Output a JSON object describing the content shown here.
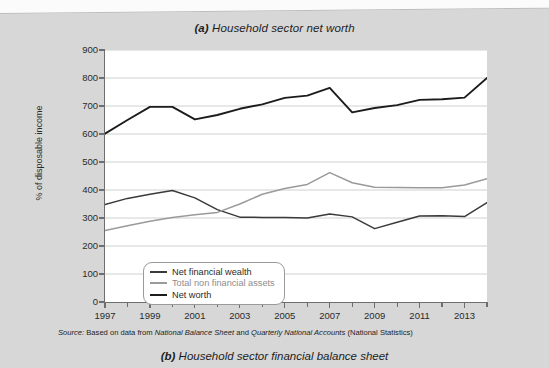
{
  "figure": {
    "title_prefix": "(a)",
    "title": "Household sector net worth",
    "bottom_caption_prefix": "(b)",
    "bottom_caption": "Household sector financial balance sheet",
    "source_prefix": "Source:",
    "source_text_1": "Based on data from",
    "source_italic_1": "National Balance Sheet",
    "source_text_2": "and",
    "source_italic_2": "Quarterly National Accounts",
    "source_text_3": "(National Statistics)"
  },
  "colors": {
    "page_background": "#d7d7d7",
    "plot_background": "#ffffff",
    "axis": "#6e6e6e",
    "gridline": "#d0d0d0",
    "net_financial_wealth": "#3a3a3a",
    "total_non_financial_assets": "#9a9a9a",
    "net_worth": "#1c1c1c",
    "text": "#2a2a2a"
  },
  "chart_data": {
    "type": "line",
    "title": "(a) Household sector net worth",
    "xlabel": "",
    "ylabel": "% of disposable income",
    "xlim": [
      1997,
      2014
    ],
    "ylim": [
      0,
      900
    ],
    "ytick_step": 100,
    "yticks": [
      0,
      100,
      200,
      300,
      400,
      500,
      600,
      700,
      800,
      900
    ],
    "xticks": [
      1997,
      1999,
      2001,
      2003,
      2005,
      2007,
      2009,
      2011,
      2013
    ],
    "xticks_minor": [
      1998,
      2000,
      2002,
      2004,
      2006,
      2008,
      2010,
      2012,
      2014
    ],
    "x": [
      1997,
      1998,
      1999,
      2000,
      2001,
      2002,
      2003,
      2004,
      2005,
      2006,
      2007,
      2008,
      2009,
      2010,
      2011,
      2012,
      2013,
      2014
    ],
    "grid": true,
    "legend_position": "lower-left-inside",
    "series": [
      {
        "name": "Net financial wealth",
        "color": "#3a3a3a",
        "values": [
          348,
          370,
          385,
          398,
          372,
          330,
          303,
          302,
          302,
          300,
          314,
          304,
          262,
          285,
          307,
          308,
          305,
          355
        ]
      },
      {
        "name": "Total non financial assets",
        "color": "#9a9a9a",
        "values": [
          255,
          272,
          288,
          302,
          312,
          320,
          350,
          385,
          405,
          420,
          462,
          426,
          410,
          409,
          408,
          408,
          418,
          440
        ]
      },
      {
        "name": "Net worth",
        "color": "#1c1c1c",
        "values": [
          601,
          650,
          697,
          697,
          652,
          668,
          690,
          706,
          729,
          737,
          765,
          677,
          693,
          703,
          722,
          724,
          730,
          800
        ]
      }
    ]
  }
}
